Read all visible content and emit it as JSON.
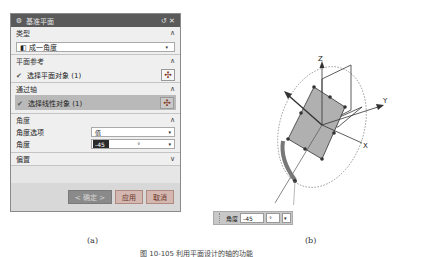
{
  "dialog": {
    "title": "基准平面",
    "title_icons": {
      "gear": "⚙",
      "reset": "↺",
      "close": "✕"
    },
    "sections": {
      "type": {
        "label": "类型",
        "collapse": "∧",
        "select_value": "成一角度",
        "select_icon": "◧",
        "caret": "▾"
      },
      "plane_ref": {
        "label": "平面参考",
        "collapse": "∧",
        "selection_label": "选择平面对象 (1)",
        "check": "✔",
        "button_icon": "✣"
      },
      "through_axis": {
        "label": "通过轴",
        "collapse": "∧",
        "selection_label": "选择线性对象 (1)",
        "check": "✔",
        "button_icon": "✣"
      },
      "angle": {
        "label": "角度",
        "collapse": "∧",
        "option_label": "角度选项",
        "option_value": "值",
        "angle_label": "角度",
        "angle_value": "-45",
        "angle_unit": "°",
        "caret": "▾"
      },
      "offset": {
        "label": "偏置",
        "collapse": "∨"
      }
    },
    "buttons": {
      "ok": "< 确定 >",
      "apply": "应用",
      "cancel": "取消"
    }
  },
  "captions": {
    "a": "(a)",
    "b": "(b)",
    "figure": "图 10-105 利用平面设计的轴的功能"
  },
  "figure": {
    "axes": {
      "z": "Z",
      "y": "Y",
      "x": "X"
    }
  },
  "mini_input": {
    "label": "角度",
    "value": "-45",
    "unit": "°",
    "caret": "▾"
  }
}
